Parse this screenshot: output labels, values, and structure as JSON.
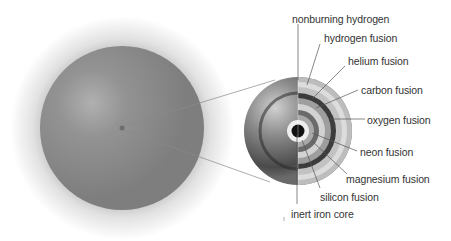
{
  "diagram": {
    "star": {
      "label": "star-exterior",
      "color": "#8a8a8a"
    },
    "cutaway": {
      "label": "star-cutaway"
    },
    "layers": [
      {
        "id": "nonburning-hydrogen",
        "label": "nonburning hydrogen",
        "color": "#bdbdbd"
      },
      {
        "id": "hydrogen-fusion",
        "label": "hydrogen fusion",
        "color": "#d8d8d8"
      },
      {
        "id": "helium-fusion",
        "label": "helium fusion",
        "color": "#c4c4c4"
      },
      {
        "id": "carbon-fusion",
        "label": "carbon fusion",
        "color": "#3a3a3a"
      },
      {
        "id": "oxygen-fusion",
        "label": "oxygen fusion",
        "color": "#a0a0a0"
      },
      {
        "id": "neon-fusion",
        "label": "neon fusion",
        "color": "#d0d0d0"
      },
      {
        "id": "magnesium-fusion",
        "label": "magnesium fusion",
        "color": "#6a6a6a"
      },
      {
        "id": "silicon-fusion",
        "label": "silicon fusion",
        "color": "#ececec"
      },
      {
        "id": "inert-iron-core",
        "label": "inert iron core",
        "color": "#111111"
      }
    ]
  }
}
